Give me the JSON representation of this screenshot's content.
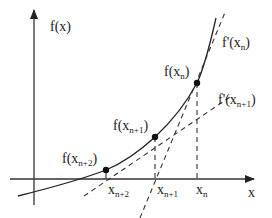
{
  "diagram": {
    "axes": {
      "y_label": "f(x)",
      "x_label": "x"
    },
    "points": [
      {
        "id": "xn",
        "label_main": "f(x",
        "label_sub": "n",
        "label_close": ")",
        "axis_main": "x",
        "axis_sub": "n"
      },
      {
        "id": "xn1",
        "label_main": "f(x",
        "label_sub": "n+1",
        "label_close": ")",
        "axis_main": "x",
        "axis_sub": "n+1"
      },
      {
        "id": "xn2",
        "label_main": "f(x",
        "label_sub": "n+2",
        "label_close": ")",
        "axis_main": "x",
        "axis_sub": "n+2"
      }
    ],
    "tangents": [
      {
        "id": "tan-xn",
        "label_main": "f'(x",
        "label_sub": "n",
        "label_close": ")"
      },
      {
        "id": "tan-xn1",
        "label_main": "f'(x",
        "label_sub": "n+1",
        "label_close": ")"
      }
    ],
    "colors": {
      "ink": "#222222",
      "axis": "#333333",
      "background": "#ffffff"
    }
  }
}
